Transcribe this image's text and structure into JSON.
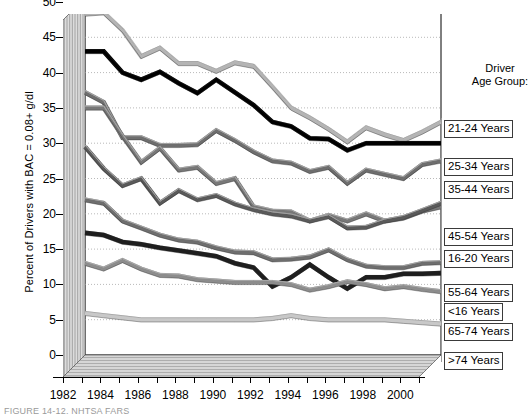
{
  "chart_data": {
    "type": "line",
    "title": "",
    "xlabel": "",
    "ylabel": "Percent of Drivers with BAC = 0.08+ g/dl",
    "xlim": [
      1982,
      2001
    ],
    "ylim": [
      0,
      50
    ],
    "ytick_values": [
      0,
      5,
      10,
      15,
      20,
      25,
      30,
      35,
      40,
      45,
      50
    ],
    "xtick_labels": [
      "1982",
      "1984",
      "1986",
      "1988",
      "1990",
      "1992",
      "1994",
      "1996",
      "1998",
      "2000"
    ],
    "xtick_values": [
      1982,
      1984,
      1986,
      1988,
      1990,
      1992,
      1994,
      1996,
      1998,
      2000
    ],
    "x": [
      1982,
      1983,
      1984,
      1985,
      1986,
      1987,
      1988,
      1989,
      1990,
      1991,
      1992,
      1993,
      1994,
      1995,
      1996,
      1997,
      1998,
      1999,
      2000,
      2001
    ],
    "grid": "horizontal-dotted",
    "legend_position": "right",
    "legend_title": "Driver\nAge Group:",
    "series": [
      {
        "name": "21-24 Years",
        "color": "#b4b4b4",
        "values": [
          48.3,
          48.5,
          46.0,
          42.3,
          43.5,
          41.3,
          41.3,
          40.2,
          41.4,
          40.9,
          38.0,
          35.0,
          33.6,
          32.0,
          30.2,
          32.2,
          31.2,
          30.4,
          31.6,
          33.0
        ]
      },
      {
        "name": "25-34 Years",
        "color": "#000000",
        "values": [
          43.0,
          43.0,
          40.0,
          39.0,
          40.1,
          38.5,
          37.1,
          39.0,
          37.2,
          35.4,
          33.0,
          32.4,
          30.7,
          30.6,
          29.0,
          30.0,
          30.0,
          30.0,
          30.0,
          30.0
        ]
      },
      {
        "name": "35-44 Years",
        "color": "#6e6e6e",
        "values": [
          37.2,
          35.8,
          30.8,
          30.8,
          29.7,
          29.7,
          29.8,
          31.8,
          30.4,
          28.8,
          27.5,
          27.2,
          26.0,
          26.6,
          24.3,
          26.2,
          25.6,
          25.0,
          27.0,
          27.5
        ]
      },
      {
        "name": "45-54 Years",
        "color": "#5a5a5a",
        "values": [
          29.5,
          26.4,
          24.0,
          25.0,
          21.5,
          23.3,
          22.0,
          22.6,
          21.4,
          20.6,
          20.0,
          19.7,
          19.0,
          19.6,
          18.0,
          18.1,
          19.0,
          19.5,
          20.5,
          21.5
        ]
      },
      {
        "name": "16-20 Years",
        "color": "#787878",
        "values": [
          35.0,
          35.0,
          31.0,
          27.3,
          29.3,
          26.2,
          26.6,
          24.3,
          25.0,
          21.0,
          20.4,
          20.3,
          19.0,
          19.8,
          19.0,
          20.0,
          19.0,
          19.4,
          20.4,
          21.0
        ]
      },
      {
        "name": "55-64 Years",
        "color": "#6e6e6e",
        "values": [
          22.0,
          21.5,
          19.0,
          18.0,
          17.0,
          16.3,
          16.0,
          15.2,
          14.6,
          14.5,
          13.5,
          13.6,
          13.9,
          14.9,
          13.5,
          12.6,
          12.4,
          12.4,
          13.0,
          13.1
        ]
      },
      {
        "name": "<16 Years",
        "color": "#1e1e1e",
        "values": [
          17.3,
          17.0,
          16.0,
          15.7,
          15.2,
          14.8,
          14.4,
          14.0,
          13.0,
          12.4,
          9.7,
          11.0,
          12.8,
          11.0,
          9.4,
          11.0,
          11.0,
          11.5,
          11.5,
          11.6
        ]
      },
      {
        "name": "65-74 Years",
        "color": "#8c8c8c",
        "values": [
          13.0,
          12.2,
          13.4,
          12.2,
          11.3,
          11.2,
          10.7,
          10.5,
          10.3,
          10.3,
          10.3,
          10.0,
          9.2,
          9.7,
          10.4,
          10.0,
          9.4,
          9.7,
          9.3,
          9.0
        ]
      },
      {
        "name": ">74 Years",
        "color": "#c8c8c8",
        "values": [
          5.9,
          5.6,
          5.3,
          5.0,
          5.0,
          5.0,
          5.0,
          5.0,
          5.0,
          5.0,
          5.2,
          5.6,
          5.2,
          5.0,
          5.0,
          5.0,
          5.0,
          4.8,
          4.6,
          4.4
        ]
      }
    ]
  },
  "legend": {
    "title_line1": "Driver",
    "title_line2": "Age Group:",
    "items": [
      {
        "label": "21-24 Years",
        "top": 120
      },
      {
        "label": "25-34 Years",
        "top": 158
      },
      {
        "label": "35-44 Years",
        "top": 181
      },
      {
        "label": "45-54 Years",
        "top": 228
      },
      {
        "label": "16-20 Years",
        "top": 250
      },
      {
        "label": "55-64 Years",
        "top": 284
      },
      {
        "label": "<16 Years",
        "top": 303
      },
      {
        "label": "65-74 Years",
        "top": 323
      },
      {
        "label": ">74 Years",
        "top": 352
      }
    ]
  },
  "caption": "FIGURE 14-12.   NHTSA FARS"
}
